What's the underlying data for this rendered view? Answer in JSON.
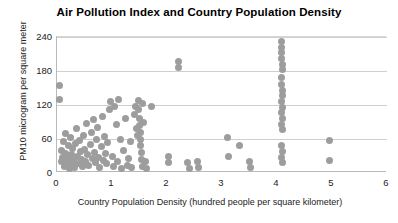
{
  "chart_data": {
    "type": "scatter",
    "title": "Air Pollution Index and Country Population Density",
    "xlabel": "Country Population Density  (hundred people per square kilometer)",
    "ylabel": "PM10 microgram per square meter",
    "xlim": [
      0,
      6
    ],
    "ylim": [
      0,
      240
    ],
    "xticks": [
      0,
      1,
      2,
      3,
      4,
      5,
      6
    ],
    "yticks": [
      0,
      60,
      120,
      180,
      240
    ],
    "grid": "horizontal",
    "legend": "none",
    "marker_color": "#9d9d9d",
    "series": [
      {
        "name": "Countries",
        "points": [
          [
            0.04,
            155
          ],
          [
            0.04,
            130
          ],
          [
            0.08,
            40
          ],
          [
            0.09,
            20
          ],
          [
            0.1,
            28
          ],
          [
            0.12,
            55
          ],
          [
            0.13,
            12
          ],
          [
            0.15,
            70
          ],
          [
            0.16,
            35
          ],
          [
            0.18,
            18
          ],
          [
            0.2,
            48
          ],
          [
            0.21,
            25
          ],
          [
            0.22,
            8
          ],
          [
            0.24,
            62
          ],
          [
            0.26,
            33
          ],
          [
            0.27,
            15
          ],
          [
            0.29,
            44
          ],
          [
            0.3,
            22
          ],
          [
            0.32,
            10
          ],
          [
            0.34,
            52
          ],
          [
            0.35,
            78
          ],
          [
            0.37,
            30
          ],
          [
            0.39,
            16
          ],
          [
            0.41,
            58
          ],
          [
            0.42,
            38
          ],
          [
            0.44,
            24
          ],
          [
            0.46,
            12
          ],
          [
            0.48,
            66
          ],
          [
            0.5,
            42
          ],
          [
            0.52,
            20
          ],
          [
            0.54,
            88
          ],
          [
            0.56,
            32
          ],
          [
            0.58,
            14
          ],
          [
            0.6,
            50
          ],
          [
            0.62,
            72
          ],
          [
            0.64,
            26
          ],
          [
            0.66,
            94
          ],
          [
            0.68,
            36
          ],
          [
            0.7,
            18
          ],
          [
            0.72,
            60
          ],
          [
            0.74,
            80
          ],
          [
            0.76,
            28
          ],
          [
            0.78,
            10
          ],
          [
            0.8,
            46
          ],
          [
            0.82,
            100
          ],
          [
            0.84,
            22
          ],
          [
            0.86,
            64
          ],
          [
            0.88,
            34
          ],
          [
            0.9,
            16
          ],
          [
            0.92,
            54
          ],
          [
            0.95,
            112
          ],
          [
            0.97,
            126
          ],
          [
            1.0,
            30
          ],
          [
            1.02,
            12
          ],
          [
            1.05,
            118
          ],
          [
            1.08,
            86
          ],
          [
            1.1,
            20
          ],
          [
            1.12,
            130
          ],
          [
            1.15,
            60
          ],
          [
            1.18,
            8
          ],
          [
            1.2,
            40
          ],
          [
            1.24,
            96
          ],
          [
            1.28,
            14
          ],
          [
            1.3,
            25
          ],
          [
            1.33,
            55
          ],
          [
            1.36,
            10
          ],
          [
            1.4,
            104
          ],
          [
            1.42,
            118
          ],
          [
            1.44,
            78
          ],
          [
            1.46,
            66
          ],
          [
            1.48,
            128
          ],
          [
            1.49,
            112
          ],
          [
            1.5,
            96
          ],
          [
            1.5,
            84
          ],
          [
            1.51,
            72
          ],
          [
            1.52,
            60
          ],
          [
            1.52,
            48
          ],
          [
            1.53,
            36
          ],
          [
            1.54,
            24
          ],
          [
            1.55,
            12
          ],
          [
            1.56,
            122
          ],
          [
            1.58,
            90
          ],
          [
            1.6,
            20
          ],
          [
            1.62,
            8
          ],
          [
            1.72,
            118
          ],
          [
            2.02,
            30
          ],
          [
            2.02,
            18
          ],
          [
            2.2,
            196
          ],
          [
            2.21,
            186
          ],
          [
            2.38,
            18
          ],
          [
            2.4,
            8
          ],
          [
            2.56,
            20
          ],
          [
            2.57,
            10
          ],
          [
            3.1,
            62
          ],
          [
            3.12,
            30
          ],
          [
            3.32,
            48
          ],
          [
            3.5,
            20
          ],
          [
            3.51,
            10
          ],
          [
            4.08,
            232
          ],
          [
            4.08,
            222
          ],
          [
            4.09,
            212
          ],
          [
            4.09,
            202
          ],
          [
            4.1,
            192
          ],
          [
            4.1,
            182
          ],
          [
            4.08,
            168
          ],
          [
            4.09,
            156
          ],
          [
            4.1,
            146
          ],
          [
            4.1,
            136
          ],
          [
            4.09,
            126
          ],
          [
            4.1,
            116
          ],
          [
            4.09,
            106
          ],
          [
            4.1,
            96
          ],
          [
            4.09,
            86
          ],
          [
            4.1,
            76
          ],
          [
            4.09,
            48
          ],
          [
            4.1,
            38
          ],
          [
            4.09,
            28
          ],
          [
            4.1,
            18
          ],
          [
            4.95,
            58
          ],
          [
            4.96,
            22
          ]
        ]
      }
    ]
  }
}
